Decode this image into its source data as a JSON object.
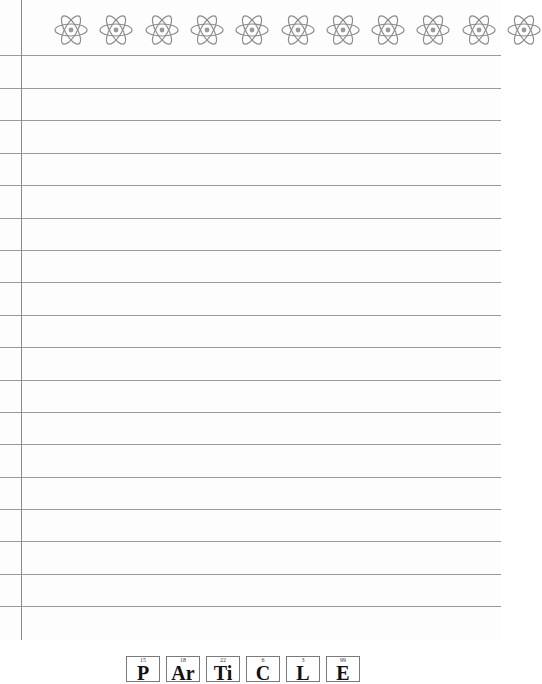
{
  "page": {
    "type": "lined-notebook-paper",
    "accent_line_color": "#9a9a9a",
    "margin_line_color": "#8a8a8a"
  },
  "header": {
    "decoration_icon": "atom-icon",
    "atom_count": 11
  },
  "rules": {
    "count": 18,
    "positions_y": [
      55,
      88,
      120,
      153,
      185,
      218,
      250,
      282,
      315,
      347,
      380,
      412,
      444,
      477,
      509,
      541,
      574,
      606
    ]
  },
  "footer": {
    "title": "PARTICLE",
    "elements": [
      {
        "number": "15",
        "symbol": "P"
      },
      {
        "number": "18",
        "symbol": "Ar"
      },
      {
        "number": "22",
        "symbol": "Ti"
      },
      {
        "number": "6",
        "symbol": "C"
      },
      {
        "number": "3",
        "symbol": "L"
      },
      {
        "number": "99",
        "symbol": "E"
      }
    ]
  }
}
